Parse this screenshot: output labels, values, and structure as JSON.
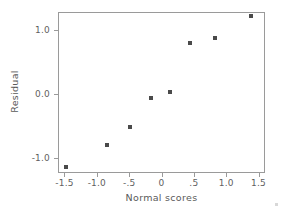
{
  "chart_data": {
    "type": "scatter",
    "title": "",
    "xlabel": "Normal scores",
    "ylabel": "Residual",
    "xlim": [
      -1.6,
      1.6
    ],
    "ylim": [
      -1.24,
      1.29
    ],
    "grid": false,
    "legend": "none",
    "marker": {
      "shape": "square",
      "color": "#4a4a4a",
      "size_px": 4
    },
    "xticks": [
      -1.5,
      -1.0,
      -0.5,
      0,
      0.5,
      1.0,
      1.5
    ],
    "xtick_labels": [
      "-1.5",
      "-1.0",
      "-.5",
      "0",
      ".5",
      "1.0",
      "1.5"
    ],
    "yticks": [
      1.0,
      0.0,
      -1.0
    ],
    "ytick_labels": [
      "1.0",
      "0.0",
      "-1.0"
    ],
    "points": [
      {
        "x": -1.47,
        "y": -1.14
      },
      {
        "x": -0.84,
        "y": -0.8
      },
      {
        "x": -0.48,
        "y": -0.52
      },
      {
        "x": -0.17,
        "y": -0.06
      },
      {
        "x": 0.13,
        "y": 0.03
      },
      {
        "x": 0.44,
        "y": 0.8
      },
      {
        "x": 0.82,
        "y": 0.88
      },
      {
        "x": 1.38,
        "y": 1.23
      }
    ],
    "x_values": [
      -1.47,
      -0.84,
      -0.48,
      -0.17,
      0.13,
      0.44,
      0.82,
      1.38
    ],
    "y_values": [
      -1.14,
      -0.8,
      -0.52,
      -0.06,
      0.03,
      0.8,
      0.88,
      1.23
    ]
  },
  "axes": {
    "frame_color": "#9a9a9a",
    "tick_color": "#9a9a9a",
    "text_color": "#5a5a5a"
  }
}
